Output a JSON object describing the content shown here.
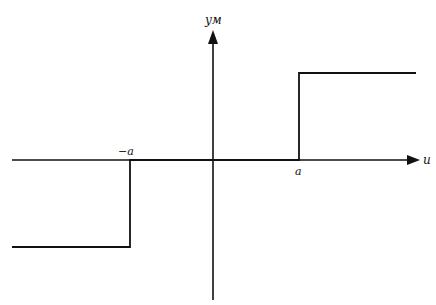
{
  "diagram": {
    "type": "relay-characteristic",
    "axes": {
      "x_label": "u",
      "y_label": "yм"
    },
    "tick_labels": {
      "negative": "−a",
      "positive": "a"
    },
    "colors": {
      "line": "#111111",
      "background": "#ffffff"
    },
    "segments": [
      {
        "name": "lower-level",
        "from": [
          "-inf",
          "-M"
        ],
        "to": [
          "-a",
          "-M"
        ]
      },
      {
        "name": "rise-at-neg-a",
        "from": [
          "-a",
          "-M"
        ],
        "to": [
          "-a",
          "0"
        ]
      },
      {
        "name": "dead-zone",
        "from": [
          "-a",
          "0"
        ],
        "to": [
          "a",
          "0"
        ]
      },
      {
        "name": "rise-at-a",
        "from": [
          "a",
          "0"
        ],
        "to": [
          "a",
          "M"
        ]
      },
      {
        "name": "upper-level",
        "from": [
          "a",
          "M"
        ],
        "to": [
          "+inf",
          "M"
        ]
      }
    ]
  }
}
